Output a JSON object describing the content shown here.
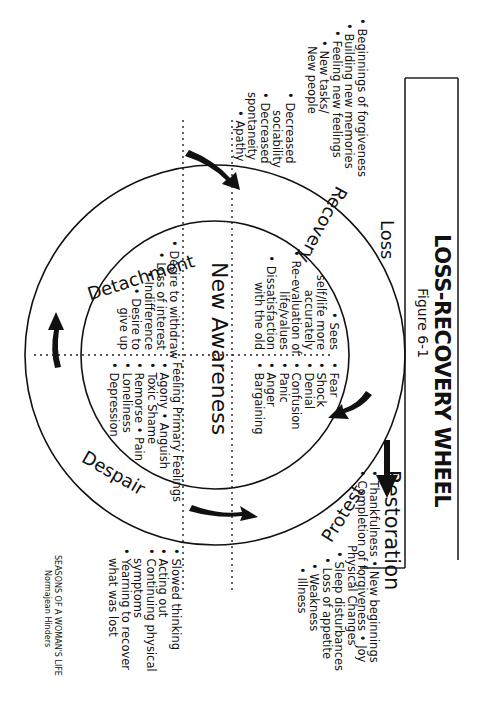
{
  "header": {
    "title": "LOSS-RECOVERY WHEEL",
    "subtitle": "Figure 6-1"
  },
  "loss_box": {
    "label": "Loss"
  },
  "restoration": {
    "label": "Restoration",
    "line1": "• Thankfulness  • New beginnings",
    "line2": "• Completion of forgiveness  • Joy"
  },
  "outer_ring": {
    "stages": [
      {
        "name": "Recovery"
      },
      {
        "name": "Protest"
      },
      {
        "name": "Despair"
      },
      {
        "name": "Detachment"
      }
    ]
  },
  "center": {
    "label": "New Awareness"
  },
  "inner_quadrants": {
    "loss_feelings": [
      "• Fear",
      "• Shock",
      "• Denial",
      "• Confusion",
      "• Panic",
      "• Anger",
      "• Bargaining"
    ],
    "recovery_feelings": [
      "• Sees",
      "self/life more",
      "accurately",
      "• Re-evaluation of",
      "life/values",
      "• Dissatisfaction",
      "with the old"
    ],
    "despair_feelings": [
      "Feeling Primary Feelings",
      "• Agony  • Anguish",
      "• Toxic Shame",
      "• Remorse  • Pain",
      "• Loneliness",
      "• Depression"
    ],
    "detachment_feelings": [
      "• Desire to withdraw",
      "• Loss of interest",
      "• Indifference",
      "• Desire to",
      "give up"
    ]
  },
  "outer_notes": {
    "recovery": [
      "• Beginnings of forgiveness",
      "• Building new memories",
      "• Feeling new feelings",
      "• New tasks/",
      "New people"
    ],
    "detachment": [
      "• Decreased",
      "sociability",
      "• Decreased",
      "spontaneity",
      "• Apathy"
    ],
    "protest": [
      "Physical Changes",
      "• Sleep disturbances",
      "• Loss of appetite",
      "• Weakness",
      "• Illness"
    ],
    "despair": [
      "• Slowed thinking",
      "• Acting out",
      "• Continuing physical",
      "symptoms",
      "• Yearning to recover",
      "what was lost"
    ]
  },
  "credit": {
    "line1": "SEASONS OF A WOMAN'S LIFE",
    "line2": "Normajean Hinders"
  },
  "colors": {
    "ink": "#111111",
    "background": "#ffffff"
  }
}
